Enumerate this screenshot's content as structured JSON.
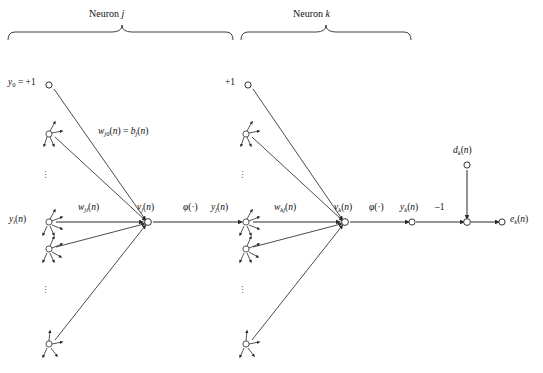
{
  "figure": {
    "type": "signal-flow-graph",
    "groups": [
      {
        "id": "neuron-j",
        "label": "Neuron j",
        "label_text": "Neuron ",
        "label_italic": "j",
        "x_start": 8,
        "x_end": 233,
        "label_cx": 122,
        "label_y": 14,
        "brace_y": 32
      },
      {
        "id": "neuron-k",
        "label": "Neuron k",
        "label_text": "Neuron ",
        "label_italic": "k",
        "x_start": 241,
        "x_end": 411,
        "label_cx": 326,
        "label_y": 14,
        "brace_y": 32
      }
    ],
    "labels": {
      "y0_bias": "y0 = +1",
      "bias_plus_one": "+1",
      "w_j0_eq_b_j": "wj0(n) = bj(n)",
      "y_i": "yi(n)",
      "w_ji": "wji(n)",
      "v_j": "vj(n)",
      "phi_j": "φ(·)",
      "y_j": "yj(n)",
      "w_kj": "wkj(n)",
      "v_k": "vk(n)",
      "phi_k": "φ(·)",
      "y_k": "yk(n)",
      "minus_one": "–1",
      "d_k": "dk(n)",
      "e_k": "ek(n)"
    },
    "nodes": [
      {
        "name": "node-y0-bias",
        "x": 49,
        "y": 85,
        "kind": "open-circle",
        "label": "y0 = +1"
      },
      {
        "name": "node-hidden-in-1",
        "x": 49,
        "y": 134,
        "kind": "starburst",
        "label": ""
      },
      {
        "name": "node-y-i",
        "x": 49,
        "y": 222,
        "kind": "starburst",
        "label": "yi(n)"
      },
      {
        "name": "node-hidden-in-3",
        "x": 49,
        "y": 249,
        "kind": "starburst",
        "label": ""
      },
      {
        "name": "node-hidden-in-4",
        "x": 49,
        "y": 344,
        "kind": "starburst",
        "label": ""
      },
      {
        "name": "node-v-j",
        "x": 148,
        "y": 222,
        "kind": "open-circle",
        "label": "vj(n)"
      },
      {
        "name": "node-bias-k",
        "x": 248,
        "y": 85,
        "kind": "open-circle",
        "label": "+1"
      },
      {
        "name": "node-output-in-1",
        "x": 246,
        "y": 134,
        "kind": "starburst",
        "label": ""
      },
      {
        "name": "node-y-j",
        "x": 246,
        "y": 222,
        "kind": "starburst",
        "label": "yj(n)"
      },
      {
        "name": "node-output-in-3",
        "x": 246,
        "y": 249,
        "kind": "starburst",
        "label": ""
      },
      {
        "name": "node-output-in-4",
        "x": 246,
        "y": 344,
        "kind": "starburst",
        "label": ""
      },
      {
        "name": "node-v-k",
        "x": 345,
        "y": 222,
        "kind": "open-circle",
        "label": "vk(n)"
      },
      {
        "name": "node-y-k",
        "x": 412,
        "y": 222,
        "kind": "open-circle",
        "label": "yk(n)"
      },
      {
        "name": "node-summing",
        "x": 467,
        "y": 222,
        "kind": "open-circle",
        "label": ""
      },
      {
        "name": "node-d-k",
        "x": 467,
        "y": 165,
        "kind": "open-circle",
        "label": "dk(n)"
      },
      {
        "name": "node-e-k",
        "x": 502,
        "y": 222,
        "kind": "open-circle",
        "label": "ek(n)"
      }
    ],
    "edges": [
      {
        "name": "edge-bias-to-vj",
        "from": "node-y0-bias",
        "to": "node-v-j",
        "weight_label": "wj0(n) = bj(n)"
      },
      {
        "name": "edge-in1-to-vj",
        "from": "node-hidden-in-1",
        "to": "node-v-j",
        "weight_label": ""
      },
      {
        "name": "edge-yi-to-vj",
        "from": "node-y-i",
        "to": "node-v-j",
        "weight_label": "wji(n)"
      },
      {
        "name": "edge-in3-to-vj",
        "from": "node-hidden-in-3",
        "to": "node-v-j",
        "weight_label": ""
      },
      {
        "name": "edge-in4-to-vj",
        "from": "node-hidden-in-4",
        "to": "node-v-j",
        "weight_label": ""
      },
      {
        "name": "edge-vj-to-yj",
        "from": "node-v-j",
        "to": "node-y-j",
        "weight_label": "φ(·)"
      },
      {
        "name": "edge-biask-to-vk",
        "from": "node-bias-k",
        "to": "node-v-k",
        "weight_label": ""
      },
      {
        "name": "edge-out1-to-vk",
        "from": "node-output-in-1",
        "to": "node-v-k",
        "weight_label": ""
      },
      {
        "name": "edge-yj-to-vk",
        "from": "node-y-j",
        "to": "node-v-k",
        "weight_label": "wkj(n)"
      },
      {
        "name": "edge-out3-to-vk",
        "from": "node-output-in-3",
        "to": "node-v-k",
        "weight_label": ""
      },
      {
        "name": "edge-out4-to-vk",
        "from": "node-output-in-4",
        "to": "node-v-k",
        "weight_label": ""
      },
      {
        "name": "edge-vk-to-yk",
        "from": "node-v-k",
        "to": "node-y-k",
        "weight_label": "φ(·)"
      },
      {
        "name": "edge-yk-to-sum",
        "from": "node-y-k",
        "to": "node-summing",
        "weight_label": "–1"
      },
      {
        "name": "edge-dk-to-sum",
        "from": "node-d-k",
        "to": "node-summing",
        "weight_label": ""
      },
      {
        "name": "edge-sum-to-ek",
        "from": "node-summing",
        "to": "node-e-k",
        "weight_label": ""
      }
    ],
    "ellipses": [
      {
        "name": "ellipsis-hidden-upper",
        "x": 45,
        "y": 173
      },
      {
        "name": "ellipsis-hidden-lower",
        "x": 45,
        "y": 288
      },
      {
        "name": "ellipsis-output-upper",
        "x": 243,
        "y": 173
      },
      {
        "name": "ellipsis-output-lower",
        "x": 243,
        "y": 288
      }
    ],
    "colors": {
      "stroke": "#2a2a2a",
      "text": "#111111",
      "background": "#ffffff"
    }
  }
}
